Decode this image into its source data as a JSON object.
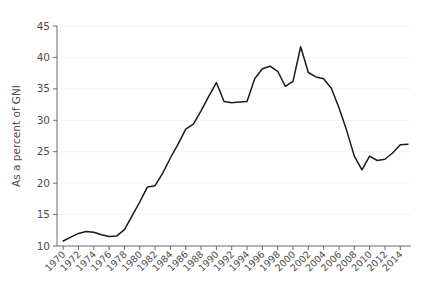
{
  "chart_data": {
    "type": "line",
    "title": "",
    "xlabel": "",
    "ylabel": "As a percent of GNI",
    "xlim": [
      1969.2,
      2015.4
    ],
    "ylim": [
      10,
      45
    ],
    "grid": true,
    "grid_axis": "y",
    "legend": "none",
    "line_color": "#1a1a1a",
    "background_color": "#ffffff",
    "axis_color": "#5a5a5a",
    "text_color": "#4d4d4d",
    "ytick_labels": [
      "10",
      "15",
      "20",
      "25",
      "30",
      "35",
      "40",
      "45"
    ],
    "ytick_values": [
      10,
      15,
      20,
      25,
      30,
      35,
      40,
      45
    ],
    "xtick_labels": [
      "1970",
      "1972",
      "1974",
      "1976",
      "1978",
      "1980",
      "1982",
      "1984",
      "1986",
      "1988",
      "1990",
      "1992",
      "1994",
      "1996",
      "1998",
      "2000",
      "2002",
      "2004",
      "2006",
      "2008",
      "2010",
      "2012",
      "2014"
    ],
    "xtick_values": [
      1970,
      1972,
      1974,
      1976,
      1978,
      1980,
      1982,
      1984,
      1986,
      1988,
      1990,
      1992,
      1994,
      1996,
      1998,
      2000,
      2002,
      2004,
      2006,
      2008,
      2010,
      2012,
      2014
    ],
    "xtick_label_rotation": 45,
    "x": [
      1970,
      1971,
      1972,
      1973,
      1974,
      1975,
      1976,
      1977,
      1978,
      1979,
      1980,
      1981,
      1982,
      1983,
      1984,
      1985,
      1986,
      1987,
      1988,
      1989,
      1990,
      1991,
      1992,
      1993,
      1994,
      1995,
      1996,
      1997,
      1998,
      1999,
      2000,
      2001,
      2002,
      2003,
      2004,
      2005,
      2006,
      2007,
      2008,
      2009,
      2010,
      2011,
      2012,
      2013,
      2014,
      2015
    ],
    "values": [
      10.8,
      11.4,
      12.0,
      12.3,
      12.2,
      11.8,
      11.5,
      11.6,
      12.6,
      14.8,
      17.0,
      19.4,
      19.6,
      21.6,
      24.0,
      26.2,
      28.6,
      29.4,
      31.5,
      33.8,
      36.0,
      33.0,
      32.8,
      32.9,
      33.0,
      36.6,
      38.2,
      38.6,
      37.8,
      35.4,
      36.2,
      41.7,
      37.6,
      36.9,
      36.6,
      35.1,
      32.0,
      28.4,
      24.3,
      22.1,
      24.3,
      23.6,
      23.8,
      24.8,
      26.1,
      26.2
    ],
    "series_name": "As a percent of GNI",
    "n_points": 46
  }
}
